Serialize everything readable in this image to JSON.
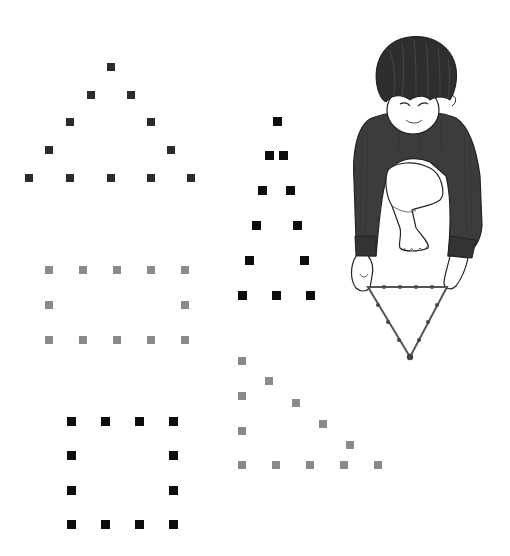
{
  "colors": {
    "background": "#ffffff",
    "dark_dot": "#2b2b2b",
    "black_dot": "#0d0d0d",
    "gray_dot": "#8a8a8a",
    "shirt": "#3c3c3c",
    "hair": "#2e2e2e",
    "skin": "#ffffff",
    "outline": "#222222",
    "string": "#555555"
  },
  "figures": [
    {
      "name": "dotted-triangle-dark",
      "shape": "triangle",
      "color": "#2b2b2b",
      "size": 8,
      "points": [
        [
          111,
          67
        ],
        [
          91,
          95
        ],
        [
          131,
          95
        ],
        [
          70,
          122
        ],
        [
          151,
          122
        ],
        [
          49,
          150
        ],
        [
          171,
          150
        ],
        [
          29,
          178
        ],
        [
          70,
          178
        ],
        [
          111,
          178
        ],
        [
          151,
          178
        ],
        [
          191,
          178
        ]
      ]
    },
    {
      "name": "dotted-rectangle-gray",
      "shape": "rectangle",
      "color": "#8a8a8a",
      "size": 8,
      "points": [
        [
          49,
          270
        ],
        [
          83,
          270
        ],
        [
          117,
          270
        ],
        [
          151,
          270
        ],
        [
          185,
          270
        ],
        [
          49,
          305
        ],
        [
          185,
          305
        ],
        [
          49,
          340
        ],
        [
          83,
          340
        ],
        [
          117,
          340
        ],
        [
          151,
          340
        ],
        [
          185,
          340
        ]
      ]
    },
    {
      "name": "dotted-square-black",
      "shape": "square",
      "color": "#0d0d0d",
      "size": 9,
      "points": [
        [
          71,
          421
        ],
        [
          105,
          421
        ],
        [
          139,
          421
        ],
        [
          173,
          421
        ],
        [
          71,
          455
        ],
        [
          173,
          455
        ],
        [
          71,
          490
        ],
        [
          173,
          490
        ],
        [
          71,
          524
        ],
        [
          105,
          524
        ],
        [
          139,
          524
        ],
        [
          173,
          524
        ]
      ]
    },
    {
      "name": "dotted-tall-triangle-black",
      "shape": "isosceles-triangle",
      "color": "#0d0d0d",
      "size": 9,
      "points": [
        [
          277,
          121
        ],
        [
          269,
          155
        ],
        [
          283,
          155
        ],
        [
          262,
          190
        ],
        [
          290,
          190
        ],
        [
          256,
          225
        ],
        [
          297,
          225
        ],
        [
          249,
          260
        ],
        [
          304,
          260
        ],
        [
          242,
          295
        ],
        [
          276,
          295
        ],
        [
          310,
          295
        ]
      ]
    },
    {
      "name": "dotted-right-triangle-gray",
      "shape": "right-triangle",
      "color": "#8a8a8a",
      "size": 8,
      "points": [
        [
          242,
          361
        ],
        [
          242,
          396
        ],
        [
          242,
          431
        ],
        [
          269,
          381
        ],
        [
          296,
          403
        ],
        [
          323,
          424
        ],
        [
          350,
          445
        ],
        [
          242,
          465
        ],
        [
          276,
          465
        ],
        [
          310,
          465
        ],
        [
          344,
          465
        ],
        [
          378,
          465
        ]
      ]
    }
  ],
  "illustration": {
    "subject": "boy-holding-string-triangle",
    "string_triangle_vertices": [
      [
        368,
        287
      ],
      [
        447,
        287
      ],
      [
        410,
        357
      ]
    ],
    "string_knots": [
      [
        384,
        287
      ],
      [
        400,
        287
      ],
      [
        416,
        287
      ],
      [
        432,
        287
      ],
      [
        378,
        305
      ],
      [
        388,
        322
      ],
      [
        399,
        340
      ],
      [
        437,
        305
      ],
      [
        428,
        322
      ],
      [
        419,
        340
      ]
    ]
  }
}
